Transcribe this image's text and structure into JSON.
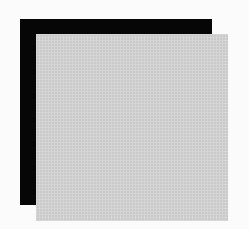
{
  "figure": {
    "shapes": [
      {
        "name": "back-square",
        "color": "#060606"
      },
      {
        "name": "front-square",
        "color": "#c9c9c9",
        "texture": "dithered"
      }
    ],
    "background": "#fbfbfb"
  }
}
